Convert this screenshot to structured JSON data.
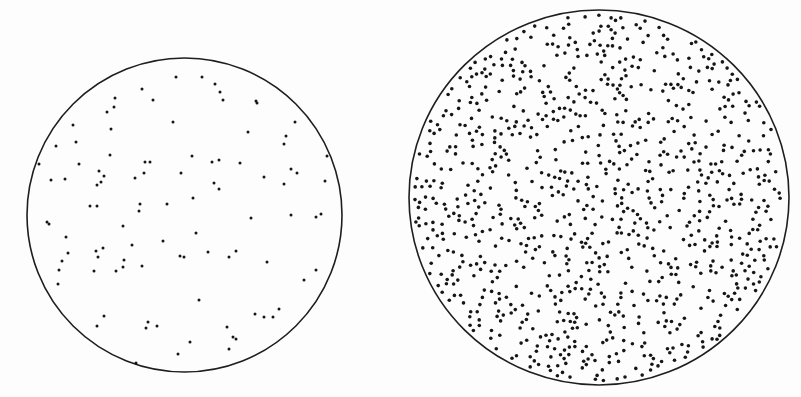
{
  "figure": {
    "width": 801,
    "height": 397,
    "background": "#fdfdfd",
    "outline_color": "#1e1e1e",
    "dot_color": "#161616"
  },
  "panels": [
    {
      "id": "left",
      "label": "dilute-sample",
      "circle": {
        "cx": 184.5,
        "cy": 215,
        "rx": 157.5,
        "ry": 157
      },
      "dot_radius": 1.5,
      "dots": [
        [
          176,
          77
        ],
        [
          202,
          77
        ],
        [
          215,
          84
        ],
        [
          220,
          92
        ],
        [
          223,
          100
        ],
        [
          256,
          101
        ],
        [
          257,
          103
        ],
        [
          142,
          89
        ],
        [
          153,
          100
        ],
        [
          115,
          98
        ],
        [
          114,
          107
        ],
        [
          107,
          112
        ],
        [
          111,
          129
        ],
        [
          73,
          125
        ],
        [
          76,
          142
        ],
        [
          56,
          146
        ],
        [
          173,
          122
        ],
        [
          248,
          132
        ],
        [
          295,
          122
        ],
        [
          286,
          136
        ],
        [
          284,
          144
        ],
        [
          327,
          156
        ],
        [
          39,
          164
        ],
        [
          79,
          164
        ],
        [
          110,
          155
        ],
        [
          145,
          162
        ],
        [
          150,
          162
        ],
        [
          144,
          173
        ],
        [
          192,
          156
        ],
        [
          212,
          162
        ],
        [
          219,
          160
        ],
        [
          240,
          163
        ],
        [
          181,
          173
        ],
        [
          99,
          171
        ],
        [
          104,
          176
        ],
        [
          101,
          182
        ],
        [
          97,
          185
        ],
        [
          135,
          178
        ],
        [
          51,
          180
        ],
        [
          65,
          179
        ],
        [
          214,
          183
        ],
        [
          219,
          189
        ],
        [
          264,
          177
        ],
        [
          291,
          169
        ],
        [
          297,
          173
        ],
        [
          284,
          184
        ],
        [
          325,
          181
        ],
        [
          193,
          198
        ],
        [
          90,
          206
        ],
        [
          97,
          206
        ],
        [
          140,
          204
        ],
        [
          139,
          211
        ],
        [
          167,
          204
        ],
        [
          47,
          222
        ],
        [
          49,
          224
        ],
        [
          251,
          218
        ],
        [
          291,
          215
        ],
        [
          316,
          217
        ],
        [
          321,
          214
        ],
        [
          123,
          226
        ],
        [
          196,
          233
        ],
        [
          66,
          237
        ],
        [
          163,
          241
        ],
        [
          132,
          245
        ],
        [
          96,
          251
        ],
        [
          103,
          248
        ],
        [
          98,
          257
        ],
        [
          68,
          253
        ],
        [
          62,
          261
        ],
        [
          59,
          270
        ],
        [
          58,
          284
        ],
        [
          94,
          271
        ],
        [
          116,
          271
        ],
        [
          123,
          267
        ],
        [
          124,
          260
        ],
        [
          142,
          266
        ],
        [
          180,
          256
        ],
        [
          184,
          257
        ],
        [
          208,
          252
        ],
        [
          229,
          257
        ],
        [
          236,
          251
        ],
        [
          267,
          262
        ],
        [
          316,
          270
        ],
        [
          304,
          280
        ],
        [
          199,
          300
        ],
        [
          104,
          316
        ],
        [
          97,
          326
        ],
        [
          148,
          322
        ],
        [
          146,
          328
        ],
        [
          157,
          326
        ],
        [
          255,
          314
        ],
        [
          264,
          317
        ],
        [
          273,
          317
        ],
        [
          279,
          309
        ],
        [
          227,
          327
        ],
        [
          233,
          337
        ],
        [
          236,
          339
        ],
        [
          229,
          349
        ],
        [
          190,
          342
        ],
        [
          178,
          354
        ],
        [
          136,
          363
        ]
      ]
    },
    {
      "id": "right",
      "label": "concentrated-sample",
      "circle": {
        "cx": 599,
        "cy": 197.5,
        "rx": 190,
        "ry": 187.5
      },
      "dot_radius": 1.8,
      "generated_dots": {
        "count": 950,
        "seed": 20240611,
        "min_spacing": 4.2,
        "edge_margin": 4
      }
    }
  ]
}
